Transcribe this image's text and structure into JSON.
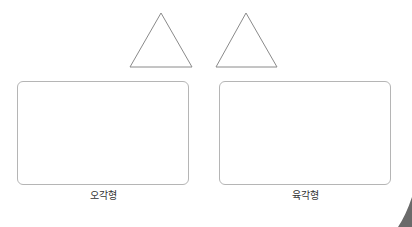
{
  "shapes": {
    "triangles": [
      {
        "name": "triangle-1",
        "points": "130,67 161,13 192,67"
      },
      {
        "name": "triangle-2",
        "points": "216,67 246,13 277,67"
      }
    ],
    "stroke_color": "#8a8a8a"
  },
  "answer_boxes": [
    {
      "label": "오각형"
    },
    {
      "label": "육각형"
    }
  ],
  "colors": {
    "box_border": "#b5b5b5",
    "corner_shade": "#6a6a6a"
  }
}
